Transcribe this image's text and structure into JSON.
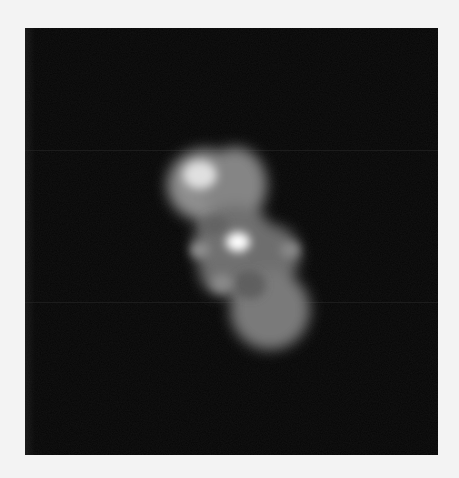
{
  "image": {
    "description": "Grayscale blurred particle/blob on dark background",
    "background_color": "#050505",
    "page_color": "#f3f3f3",
    "frame": {
      "x": 25,
      "y": 28,
      "width": 413,
      "height": 427
    },
    "scanlines_y": [
      150,
      302
    ],
    "blob": {
      "lobes": [
        {
          "name": "upper-lobe",
          "cx": 205,
          "cy": 185,
          "rx": 38,
          "ry": 36,
          "shade": "#8e8e8e"
        },
        {
          "name": "upper-right-lobe",
          "cx": 235,
          "cy": 185,
          "rx": 32,
          "ry": 38,
          "shade": "#858585"
        },
        {
          "name": "middle-lobe",
          "cx": 235,
          "cy": 245,
          "rx": 42,
          "ry": 40,
          "shade": "#6f6f6f"
        },
        {
          "name": "middle-right-lobe",
          "cx": 272,
          "cy": 255,
          "rx": 28,
          "ry": 30,
          "shade": "#6e6e6e"
        },
        {
          "name": "lower-left-lobe",
          "cx": 225,
          "cy": 270,
          "rx": 26,
          "ry": 26,
          "shade": "#707070"
        },
        {
          "name": "lower-lobe",
          "cx": 270,
          "cy": 310,
          "rx": 40,
          "ry": 40,
          "shade": "#7a7a7a"
        }
      ],
      "highlights": [
        {
          "name": "bright-spot-top",
          "cx": 200,
          "cy": 175,
          "r": 14,
          "shade": "#e0e0e0"
        },
        {
          "name": "bright-spot-center",
          "cx": 238,
          "cy": 242,
          "r": 10,
          "shade": "#ffffff"
        },
        {
          "name": "faint-spot-left",
          "cx": 200,
          "cy": 250,
          "r": 8,
          "shade": "#909090"
        },
        {
          "name": "faint-spot-bottom",
          "cx": 222,
          "cy": 283,
          "r": 9,
          "shade": "#8a8a8a"
        },
        {
          "name": "faint-spot-right",
          "cx": 290,
          "cy": 250,
          "r": 8,
          "shade": "#8a8a8a"
        }
      ]
    }
  }
}
